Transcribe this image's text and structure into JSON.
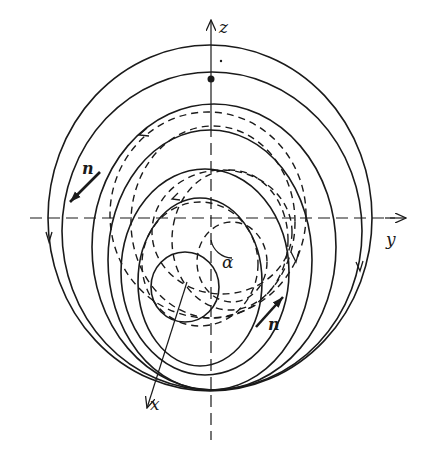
{
  "diagram": {
    "type": "geometric-diagram",
    "axes": {
      "z": {
        "label": "z"
      },
      "y": {
        "label": "y"
      },
      "x": {
        "label": "x"
      }
    },
    "labels": {
      "normal_left": "n",
      "normal_right": "n",
      "angle": "α"
    },
    "solid_circles": [
      {
        "cx": 210,
        "cy": 218,
        "rx": 162,
        "ry": 173
      },
      {
        "cx": 212,
        "cy": 231,
        "rx": 150,
        "ry": 159
      },
      {
        "cx": 214,
        "cy": 247,
        "rx": 122,
        "ry": 143
      },
      {
        "cx": 210,
        "cy": 260,
        "rx": 102,
        "ry": 130
      },
      {
        "cx": 205,
        "cy": 272,
        "rx": 84,
        "ry": 103
      },
      {
        "cx": 200,
        "cy": 282,
        "rx": 62,
        "ry": 84
      },
      {
        "cx": 185,
        "cy": 287,
        "rx": 34,
        "ry": 35
      }
    ],
    "dashed_circles": [
      {
        "cx": 208,
        "cy": 215,
        "rx": 98,
        "ry": 103
      },
      {
        "cx": 213,
        "cy": 222,
        "rx": 82,
        "ry": 96
      },
      {
        "cx": 222,
        "cy": 232,
        "rx": 70,
        "ry": 62
      },
      {
        "cx": 230,
        "cy": 240,
        "rx": 58,
        "ry": 70
      },
      {
        "cx": 200,
        "cy": 264,
        "rx": 58,
        "ry": 62
      },
      {
        "cx": 232,
        "cy": 262,
        "rx": 35,
        "ry": 40
      }
    ],
    "points": [
      {
        "name": "large-dot",
        "x": 211,
        "y": 79,
        "r": 3.5
      },
      {
        "name": "small-dot",
        "x": 221,
        "y": 61,
        "r": 1.2
      }
    ]
  }
}
